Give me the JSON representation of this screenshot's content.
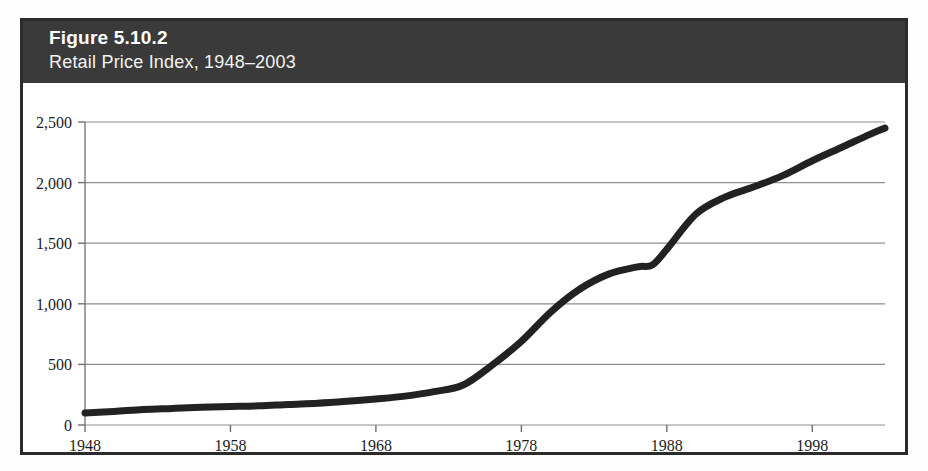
{
  "figure": {
    "number_label": "Figure 5.10.2",
    "subtitle": "Retail Price Index, 1948–2003",
    "header_bg": "#3a3a3a",
    "frame_border_color": "#2b2b2b",
    "plot_bg": "#ffffff"
  },
  "chart_data": {
    "type": "line",
    "title": "Figure 5.10.2",
    "subtitle": "Retail Price Index, 1948–2003",
    "xlabel": "",
    "ylabel": "",
    "xlim": [
      1948,
      2003
    ],
    "ylim": [
      0,
      2500
    ],
    "grid": true,
    "legend": "none",
    "series_color": "#222222",
    "x_ticks": [
      1948,
      1958,
      1968,
      1978,
      1988,
      1998
    ],
    "x_tick_labels": [
      "1948",
      "1958",
      "1968",
      "1978",
      "1988",
      "1998"
    ],
    "y_ticks": [
      0,
      500,
      1000,
      1500,
      2000,
      2500
    ],
    "y_tick_labels": [
      "0",
      "500",
      "1,000",
      "1,500",
      "2,000",
      "2,500"
    ],
    "series": [
      {
        "name": "Retail Price Index",
        "x": [
          1948,
          1950,
          1952,
          1954,
          1956,
          1958,
          1960,
          1962,
          1964,
          1966,
          1968,
          1970,
          1972,
          1974,
          1976,
          1978,
          1980,
          1982,
          1984,
          1986,
          1987,
          1988,
          1990,
          1992,
          1994,
          1996,
          1998,
          2000,
          2002,
          2003
        ],
        "values": [
          100,
          112,
          128,
          137,
          146,
          152,
          158,
          170,
          180,
          196,
          215,
          238,
          275,
          330,
          495,
          690,
          930,
          1120,
          1245,
          1305,
          1320,
          1450,
          1740,
          1880,
          1965,
          2060,
          2180,
          2290,
          2400,
          2450
        ]
      }
    ]
  }
}
